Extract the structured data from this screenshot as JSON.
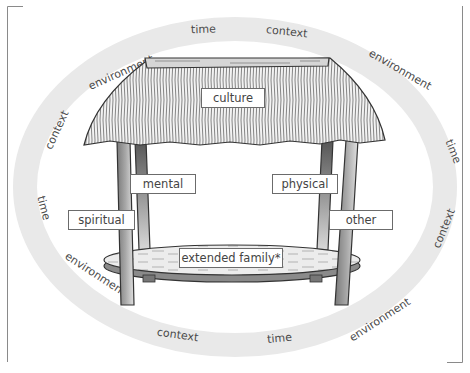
{
  "diagram": {
    "type": "Fonofale model illustration",
    "labels": {
      "roof": "culture",
      "posts": [
        "spiritual",
        "mental",
        "physical",
        "other"
      ],
      "foundation": "extended family*"
    },
    "ring_words": {
      "top_left_context": "context",
      "top_left_environment": "environment",
      "top_time": "time",
      "top_right_context": "context",
      "top_right_environment": "environment",
      "right_time": "time",
      "right_context": "context",
      "bottom_right_environment": "environment",
      "bottom_time": "time",
      "bottom_context": "context",
      "bottom_left_environment": "environment",
      "left_time": "time"
    },
    "colors": {
      "ring": "#e9e9e9",
      "frame": "#8a8a8a",
      "label_border": "#6b6b6b",
      "post_dark": "#6e6e6e",
      "post_light": "#d8d8d8"
    }
  }
}
